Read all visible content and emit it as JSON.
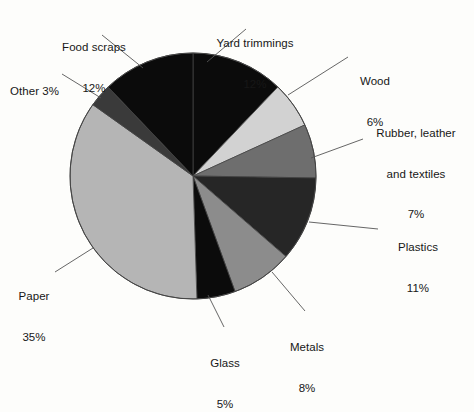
{
  "figure": {
    "background_color": "#fdfdfb",
    "text_color": "#171717",
    "leader_line_color": "#555555",
    "pie_outline_color": "#444444"
  },
  "chart_data": {
    "type": "pie",
    "title": "",
    "subtitle": "",
    "xlabel": "",
    "ylabel": "",
    "units": "percent",
    "start_angle_deg": 0,
    "direction": "clockwise",
    "legend_position": "none",
    "labels_outside": true,
    "categories": [
      "Yard trimmings",
      "Wood",
      "Rubber, leather and textiles",
      "Plastics",
      "Metals",
      "Glass",
      "Paper",
      "Other",
      "Food scraps"
    ],
    "values": [
      12,
      6,
      7,
      11,
      8,
      5,
      35,
      3,
      12
    ],
    "colors": [
      "#0b0b0b",
      "#d2d2d2",
      "#6e6e6e",
      "#262626",
      "#8c8c8c",
      "#0b0b0b",
      "#b5b5b5",
      "#3a3a3a",
      "#0b0b0b"
    ],
    "slices": [
      {
        "name": "Yard trimmings",
        "value": 12,
        "percent_label": "12%",
        "color": "#0b0b0b"
      },
      {
        "name": "Wood",
        "value": 6,
        "percent_label": "6%",
        "color": "#d2d2d2"
      },
      {
        "name": "Rubber, leather and textiles",
        "value": 7,
        "percent_label": "7%",
        "color": "#6e6e6e"
      },
      {
        "name": "Plastics",
        "value": 11,
        "percent_label": "11%",
        "color": "#262626"
      },
      {
        "name": "Metals",
        "value": 8,
        "percent_label": "8%",
        "color": "#8c8c8c"
      },
      {
        "name": "Glass",
        "value": 5,
        "percent_label": "5%",
        "color": "#0b0b0b"
      },
      {
        "name": "Paper",
        "value": 35,
        "percent_label": "35%",
        "color": "#b5b5b5"
      },
      {
        "name": "Other",
        "value": 3,
        "percent_label": "3%",
        "color": "#3a3a3a"
      },
      {
        "name": "Food scraps",
        "value": 12,
        "percent_label": "12%",
        "color": "#0b0b0b"
      }
    ]
  },
  "labels": {
    "yard_trimmings": {
      "name": "Yard trimmings",
      "percent": "12%"
    },
    "wood": {
      "name": "Wood",
      "percent": "6%"
    },
    "rubber": {
      "line1": "Rubber, leather",
      "line2": "and textiles",
      "percent": "7%"
    },
    "plastics": {
      "name": "Plastics",
      "percent": "11%"
    },
    "metals": {
      "name": "Metals",
      "percent": "8%"
    },
    "glass": {
      "name": "Glass",
      "percent": "5%"
    },
    "paper": {
      "name": "Paper",
      "percent": "35%"
    },
    "other": {
      "name": "Other 3%"
    },
    "food_scraps": {
      "name": "Food scraps",
      "percent": "12%"
    }
  }
}
